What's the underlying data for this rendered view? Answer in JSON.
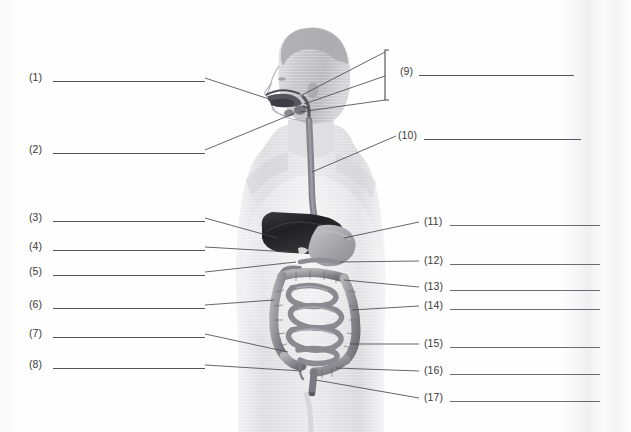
{
  "worksheet": {
    "title": "Digestive System Labeling Worksheet",
    "subject": "human digestive system anatomy diagram",
    "answer_lines_blank": true
  },
  "figure": {
    "name": "human-body-digestive-system",
    "organs": [
      "mouth",
      "tongue",
      "salivary-glands",
      "pharynx",
      "epiglottis",
      "esophagus",
      "liver",
      "gallbladder",
      "stomach",
      "pancreas",
      "duodenum",
      "small-intestine",
      "ascending-colon",
      "transverse-colon",
      "descending-colon",
      "cecum",
      "appendix",
      "sigmoid-colon",
      "rectum",
      "anus"
    ]
  },
  "labels_left": [
    {
      "id": "1",
      "text": "(1)",
      "y": 78
    },
    {
      "id": "2",
      "text": "(2)",
      "y": 150
    },
    {
      "id": "3",
      "text": "(3)",
      "y": 218
    },
    {
      "id": "4",
      "text": "(4)",
      "y": 247
    },
    {
      "id": "5",
      "text": "(5)",
      "y": 272
    },
    {
      "id": "6",
      "text": "(6)",
      "y": 305
    },
    {
      "id": "7",
      "text": "(7)",
      "y": 334
    },
    {
      "id": "8",
      "text": "(8)",
      "y": 365
    }
  ],
  "labels_right": [
    {
      "id": "9",
      "text": "(9)",
      "y": 72
    },
    {
      "id": "10",
      "text": "(10)",
      "y": 136
    },
    {
      "id": "11",
      "text": "(11)",
      "y": 222
    },
    {
      "id": "12",
      "text": "(12)",
      "y": 261
    },
    {
      "id": "13",
      "text": "(13)",
      "y": 287
    },
    {
      "id": "14",
      "text": "(14)",
      "y": 306
    },
    {
      "id": "15",
      "text": "(15)",
      "y": 344
    },
    {
      "id": "16",
      "text": "(16)",
      "y": 371
    },
    {
      "id": "17",
      "text": "(17)",
      "y": 398
    }
  ],
  "colors": {
    "page": "#fefefe",
    "ink": "#3a3a3a",
    "rule": "#55555c",
    "leader": "#4a4a50",
    "body_light": "#e8e8ea",
    "body_mid": "#cfcfd2",
    "body_shadow": "#b8b8bc",
    "liver_dark": "#2b2b2d",
    "organ_gray": "#9a9a9e",
    "organ_gray_dark": "#7d7d82"
  }
}
